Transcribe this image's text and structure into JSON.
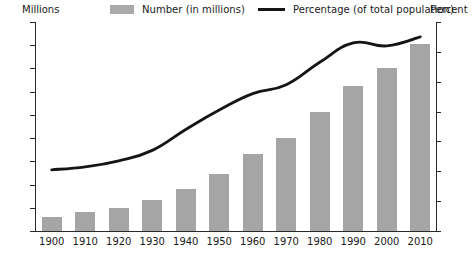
{
  "chart_data": {
    "type": "bar",
    "title": "",
    "subtitle": "",
    "xlabel": "",
    "ylabel": "Millions",
    "y2label": "Percent",
    "ylim": [
      0,
      45
    ],
    "y2lim": [
      0,
      14
    ],
    "grid": false,
    "legend_position": "top",
    "categories": [
      "1900",
      "1910",
      "1920",
      "1930",
      "1940",
      "1950",
      "1960",
      "1970",
      "1980",
      "1990",
      "2000",
      "2010"
    ],
    "y_ticks": [
      "0",
      "5",
      "10",
      "15",
      "20",
      "25",
      "30",
      "35",
      "40",
      "45"
    ],
    "y2_ticks": [
      "0",
      "2",
      "4",
      "6",
      "8",
      "10",
      "12",
      "14"
    ],
    "series": [
      {
        "name": "Number (in millions)",
        "type": "bar",
        "axis": "left",
        "color": "#a5a5a5",
        "values": [
          3.1,
          4.0,
          4.9,
          6.6,
          9.0,
          12.3,
          16.6,
          20.1,
          25.7,
          31.2,
          35.0,
          40.3
        ]
      },
      {
        "name": "Percentage (of total population)",
        "type": "line",
        "axis": "right",
        "color": "#151515",
        "values": [
          4.1,
          4.3,
          4.7,
          5.4,
          6.8,
          8.1,
          9.2,
          9.8,
          11.3,
          12.6,
          12.4,
          13.0
        ]
      }
    ]
  },
  "legend": {
    "bars_label": "Number (in millions)",
    "line_label": "Percentage (of total population)",
    "bars_swatch_color": "#a9a9a9",
    "line_swatch_color": "#151515"
  },
  "axes": {
    "left_caption": "Millions",
    "right_caption": "Percent"
  }
}
